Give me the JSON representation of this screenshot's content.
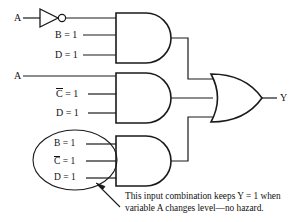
{
  "figure": {
    "type": "logic-circuit-diagram",
    "output_label": "Y",
    "colors": {
      "line": "#1a1a1a",
      "background": "#ffffff",
      "text": "#111111"
    }
  },
  "inputs": {
    "inverter_input_label": "A",
    "and1": [
      {
        "label": "B = 1"
      },
      {
        "label": "D = 1"
      }
    ],
    "and2_direct_label": "A",
    "and2": [
      {
        "prefix": "C",
        "overline": true,
        "suffix": " = 1"
      },
      {
        "label": "D = 1"
      }
    ],
    "and3": [
      {
        "label": "B = 1"
      },
      {
        "prefix": "C",
        "overline": true,
        "suffix": " = 1"
      },
      {
        "label": "D = 1"
      }
    ]
  },
  "gates": {
    "inverter": {
      "name": "NOT gate",
      "symbol": "inverter-with-bubble"
    },
    "and_gates": [
      {
        "name": "AND gate 1"
      },
      {
        "name": "AND gate 2"
      },
      {
        "name": "AND gate 3"
      }
    ],
    "or_gate": {
      "name": "OR gate"
    }
  },
  "annotation": {
    "ellipse_name": "input-combination-highlight",
    "caption_line1": "This input combination keeps Y = 1 when",
    "caption_line2": "variable A changes level—no hazard."
  }
}
